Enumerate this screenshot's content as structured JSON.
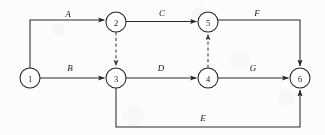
{
  "diagram": {
    "type": "activity-on-arrow-network-diagram",
    "title": "",
    "colors": {
      "background": "#fcfcfc",
      "stroke": "#2b2b2b",
      "dashed_stroke": "#4a4a4a",
      "node_fill": "#ffffff",
      "text": "#1a1a1a"
    },
    "nodes": [
      {
        "id": "1",
        "label": "1",
        "cx": 30,
        "cy": 78,
        "r": 10
      },
      {
        "id": "2",
        "label": "2",
        "cx": 116,
        "cy": 22,
        "r": 10
      },
      {
        "id": "3",
        "label": "3",
        "cx": 116,
        "cy": 78,
        "r": 10
      },
      {
        "id": "4",
        "label": "4",
        "cx": 208,
        "cy": 78,
        "r": 10
      },
      {
        "id": "5",
        "label": "5",
        "cx": 208,
        "cy": 22,
        "r": 10
      },
      {
        "id": "6",
        "label": "6",
        "cx": 300,
        "cy": 78,
        "r": 10
      }
    ],
    "edges": [
      {
        "id": "A",
        "label": "A",
        "from": "1",
        "to": "2",
        "style": "solid",
        "label_x": 68,
        "label_y": 14
      },
      {
        "id": "B",
        "label": "B",
        "from": "1",
        "to": "3",
        "style": "solid",
        "label_x": 70,
        "label_y": 68
      },
      {
        "id": "C",
        "label": "C",
        "from": "2",
        "to": "5",
        "style": "solid",
        "label_x": 162,
        "label_y": 13
      },
      {
        "id": "D",
        "label": "D",
        "from": "3",
        "to": "4",
        "style": "solid",
        "label_x": 161,
        "label_y": 68
      },
      {
        "id": "E",
        "label": "E",
        "from": "3",
        "to": "6",
        "style": "solid",
        "label_x": 203,
        "label_y": 118
      },
      {
        "id": "F",
        "label": "F",
        "from": "5",
        "to": "6",
        "style": "solid",
        "label_x": 257,
        "label_y": 13
      },
      {
        "id": "G",
        "label": "G",
        "from": "4",
        "to": "6",
        "style": "solid",
        "label_x": 253,
        "label_y": 68
      },
      {
        "id": "dummy-2-3",
        "label": "",
        "from": "2",
        "to": "3",
        "style": "dashed",
        "label_x": 0,
        "label_y": 0
      },
      {
        "id": "dummy-4-5",
        "label": "",
        "from": "4",
        "to": "5",
        "style": "dashed",
        "label_x": 0,
        "label_y": 0
      }
    ]
  }
}
